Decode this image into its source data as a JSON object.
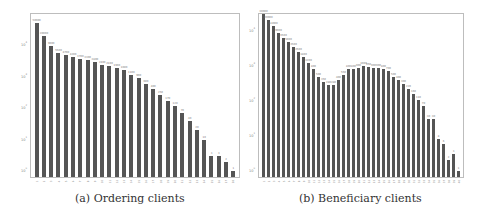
{
  "chart_data": [
    {
      "type": "bar",
      "title": "(a) Ordering clients",
      "xlabel": "",
      "ylabel": "",
      "yscale": "log",
      "ylim": [
        1,
        60000
      ],
      "yticks": [
        "10^0",
        "10^1",
        "10^2",
        "10^3",
        "10^4"
      ],
      "grid": false,
      "categories": [
        "1",
        "2",
        "3",
        "4",
        "5",
        "6",
        "7",
        "8",
        "9",
        "10",
        "11",
        "12",
        "13",
        "14",
        "15",
        "16",
        "17",
        "18",
        "19",
        "20",
        "21",
        "22",
        "23",
        "24",
        "25",
        "26",
        "27",
        "28"
      ],
      "values": [
        50000,
        20000,
        9000,
        5500,
        4700,
        4200,
        3700,
        3300,
        2800,
        2400,
        2100,
        1900,
        1600,
        1100,
        900,
        600,
        400,
        250,
        170,
        120,
        70,
        40,
        20,
        10,
        3,
        3,
        2,
        1
      ]
    },
    {
      "type": "bar",
      "title": "(b) Beneficiary clients",
      "xlabel": "",
      "ylabel": "",
      "yscale": "log",
      "ylim": [
        1,
        60000
      ],
      "yticks": [
        "10^0",
        "10^1",
        "10^2",
        "10^3",
        "10^4"
      ],
      "grid": false,
      "categories": [
        "1",
        "2",
        "3",
        "4",
        "5",
        "6",
        "7",
        "8",
        "9",
        "10",
        "11",
        "12",
        "13",
        "14",
        "15",
        "16",
        "17",
        "18",
        "19",
        "20",
        "21",
        "22",
        "23",
        "24",
        "25",
        "26",
        "27",
        "28",
        "29",
        "30",
        "31",
        "32",
        "33",
        "34",
        "35",
        "36",
        "37",
        "38",
        "39",
        "40"
      ],
      "values": [
        30000,
        20000,
        14000,
        9000,
        6500,
        5000,
        3500,
        2500,
        1800,
        1200,
        800,
        500,
        350,
        280,
        280,
        400,
        550,
        800,
        800,
        900,
        1000,
        950,
        900,
        900,
        800,
        700,
        500,
        400,
        300,
        220,
        160,
        110,
        70,
        30,
        30,
        8,
        6,
        2,
        3,
        1
      ]
    }
  ],
  "captions": {
    "a": "(a) Ordering clients",
    "b": "(b) Beneficiary clients"
  },
  "colors": {
    "bar": "#555555",
    "frame": "#bdbdbd"
  }
}
